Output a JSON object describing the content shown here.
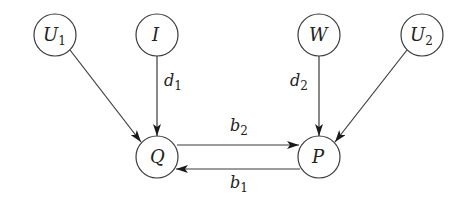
{
  "diagram": {
    "type": "directed-graph",
    "nodes": [
      {
        "id": "U1",
        "base": "U",
        "sub": "1",
        "x": 55,
        "y": 35
      },
      {
        "id": "I",
        "base": "I",
        "sub": "",
        "x": 157,
        "y": 35
      },
      {
        "id": "W",
        "base": "W",
        "sub": "",
        "x": 319,
        "y": 35
      },
      {
        "id": "U2",
        "base": "U",
        "sub": "2",
        "x": 422,
        "y": 35
      },
      {
        "id": "Q",
        "base": "Q",
        "sub": "",
        "x": 157,
        "y": 157
      },
      {
        "id": "P",
        "base": "P",
        "sub": "",
        "x": 319,
        "y": 157
      }
    ],
    "edges": [
      {
        "from": "U1",
        "to": "Q",
        "label_base": "",
        "label_sub": ""
      },
      {
        "from": "I",
        "to": "Q",
        "label_base": "d",
        "label_sub": "1"
      },
      {
        "from": "W",
        "to": "P",
        "label_base": "d",
        "label_sub": "2"
      },
      {
        "from": "U2",
        "to": "P",
        "label_base": "",
        "label_sub": ""
      },
      {
        "from": "Q",
        "to": "P",
        "label_base": "b",
        "label_sub": "2"
      },
      {
        "from": "P",
        "to": "Q",
        "label_base": "b",
        "label_sub": "1"
      }
    ],
    "colors": {
      "stroke": "#3a3a3a",
      "text": "#222222",
      "background": "#ffffff"
    }
  }
}
